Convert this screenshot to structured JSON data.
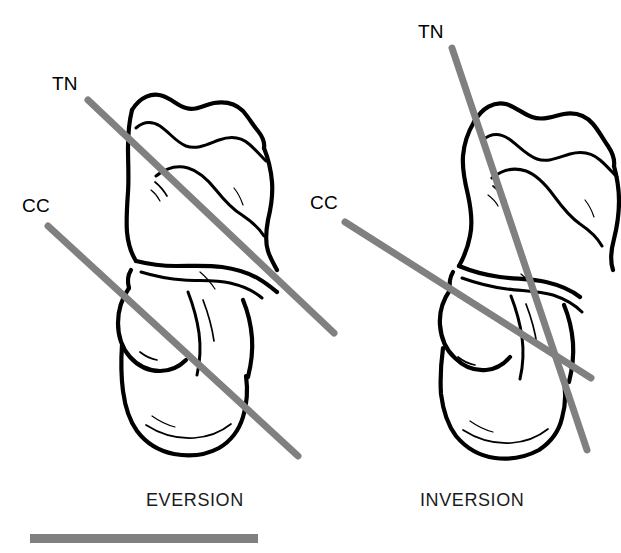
{
  "figure": {
    "width": 621,
    "height": 553,
    "background_color": "#ffffff",
    "axis_line_color": "#808080",
    "bone_outline_color": "#000000",
    "text_color": "#000000",
    "scale_bar_color": "#808080"
  },
  "panels": [
    {
      "id": "eversion",
      "caption": "EVERSION",
      "caption_x": 146,
      "caption_y": 491,
      "labels": [
        {
          "name": "TN",
          "text": "TN",
          "x": 52,
          "y": 74
        },
        {
          "name": "CC",
          "text": "CC",
          "x": 22,
          "y": 196
        }
      ],
      "axes": [
        {
          "name": "talonavicular-axis",
          "label": "TN",
          "x1": 88,
          "y1": 100,
          "x2": 334,
          "y2": 333,
          "width": 7,
          "color": "#808080"
        },
        {
          "name": "calcaneocuboid-axis",
          "label": "CC",
          "x1": 48,
          "y1": 226,
          "x2": 298,
          "y2": 456,
          "width": 7,
          "color": "#808080"
        }
      ],
      "axis_relationship": "parallel"
    },
    {
      "id": "inversion",
      "caption": "INVERSION",
      "caption_x": 420,
      "caption_y": 491,
      "labels": [
        {
          "name": "TN",
          "text": "TN",
          "x": 418,
          "y": 22
        },
        {
          "name": "CC",
          "text": "CC",
          "x": 310,
          "y": 193
        }
      ],
      "axes": [
        {
          "name": "talonavicular-axis",
          "label": "TN",
          "x1": 452,
          "y1": 48,
          "x2": 587,
          "y2": 450,
          "width": 7,
          "color": "#808080"
        },
        {
          "name": "calcaneocuboid-axis",
          "label": "CC",
          "x1": 345,
          "y1": 222,
          "x2": 591,
          "y2": 378,
          "width": 7,
          "color": "#808080"
        }
      ],
      "axis_relationship": "convergent"
    }
  ],
  "scale_bar": {
    "name": "scale-bar",
    "x": 30,
    "y": 534,
    "width": 228,
    "height": 9,
    "color": "#808080"
  }
}
